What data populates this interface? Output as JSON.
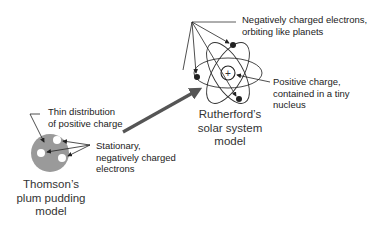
{
  "diagram": {
    "type": "atomic-models-comparison",
    "thomson": {
      "title_lines": [
        "Thomson’s",
        "plum pudding",
        "model"
      ],
      "label_positive": [
        "Thin distribution",
        "of positive charge"
      ],
      "label_electrons": [
        "Stationary,",
        "negatively charged",
        "electrons"
      ],
      "colors": {
        "body": "#9a9a9a",
        "electron": "#ffffff"
      }
    },
    "rutherford": {
      "title_lines": [
        "Rutherford’s",
        "solar system",
        "model"
      ],
      "label_electrons": [
        "Negatively charged electrons,",
        "orbiting like planets"
      ],
      "label_nucleus": [
        "Positive charge,",
        "contained in a tiny",
        "nucleus"
      ],
      "nucleus_symbol": "+",
      "colors": {
        "orbit": "#333333",
        "electron": "#222222"
      }
    },
    "transition_arrow": {
      "color": "#555555"
    }
  }
}
